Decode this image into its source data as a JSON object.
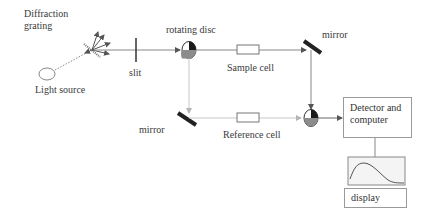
{
  "diagram": {
    "labels": {
      "grating_line1": "Diffraction",
      "grating_line2": "grating",
      "light_source": "Light source",
      "slit": "slit",
      "rotating_disc": "rotating disc",
      "sample_cell": "Sample cell",
      "mirror_top": "mirror",
      "mirror_bottom": "mirror",
      "reference_cell": "Reference cell",
      "detector_line1": "Detector and",
      "detector_line2": "computer",
      "display": "display"
    },
    "colors": {
      "line": "#8a8a8a",
      "dark": "#222222",
      "disc_dark": "#1a1a1a",
      "disc_grey": "#8c8c8c",
      "box_border": "#9a9a9a"
    },
    "nodes": [
      {
        "id": "light-source",
        "type": "ellipse"
      },
      {
        "id": "diffraction-grating",
        "type": "grating"
      },
      {
        "id": "slit",
        "type": "slit"
      },
      {
        "id": "rotating-disc-1",
        "type": "disc"
      },
      {
        "id": "sample-cell",
        "type": "cell"
      },
      {
        "id": "mirror-top",
        "type": "mirror"
      },
      {
        "id": "mirror-bottom",
        "type": "mirror"
      },
      {
        "id": "reference-cell",
        "type": "cell"
      },
      {
        "id": "rotating-disc-2",
        "type": "disc"
      },
      {
        "id": "detector-computer",
        "type": "box"
      },
      {
        "id": "display",
        "type": "box"
      }
    ],
    "edges": [
      {
        "from": "light-source",
        "to": "diffraction-grating",
        "style": "dotted"
      },
      {
        "from": "diffraction-grating",
        "to": "slit"
      },
      {
        "from": "slit",
        "to": "rotating-disc-1"
      },
      {
        "from": "rotating-disc-1",
        "to": "sample-cell"
      },
      {
        "from": "sample-cell",
        "to": "mirror-top"
      },
      {
        "from": "mirror-top",
        "to": "rotating-disc-2"
      },
      {
        "from": "rotating-disc-1",
        "to": "mirror-bottom",
        "style": "light"
      },
      {
        "from": "mirror-bottom",
        "to": "reference-cell",
        "style": "light"
      },
      {
        "from": "reference-cell",
        "to": "rotating-disc-2",
        "style": "light"
      },
      {
        "from": "rotating-disc-2",
        "to": "detector-computer"
      },
      {
        "from": "detector-computer",
        "to": "display"
      }
    ]
  }
}
